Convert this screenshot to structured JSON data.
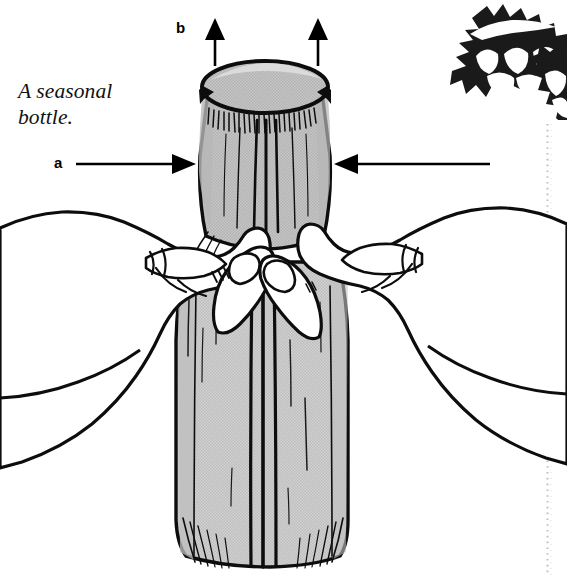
{
  "figure": {
    "title": "A seasonal bottle.",
    "caption_line_1": "A seasonal",
    "caption_line_2": "bottle.",
    "labels": {
      "a": "a",
      "b": "b"
    },
    "icons": {
      "holly_decoration": "holly-leaf-icon",
      "arrow_up_left": "arrow-up-icon",
      "arrow_up_right": "arrow-up-icon",
      "arrow_right_a": "arrow-right-icon",
      "arrow_left_unlabeled": "arrow-left-icon",
      "dotted_rule": "vertical-dotted-divider-icon"
    },
    "subject": {
      "object_name": "fabric-wrapped-bottle",
      "hands": [
        "left-hand",
        "right-hand"
      ]
    },
    "colors": {
      "ink": "#000000",
      "paper": "#ffffff",
      "wrap_fill": "#c9c9c9",
      "wrap_fill_light": "#d6d6d6",
      "shade": "#b4b4b4",
      "dotted_rule": "#bdbdbd"
    }
  }
}
